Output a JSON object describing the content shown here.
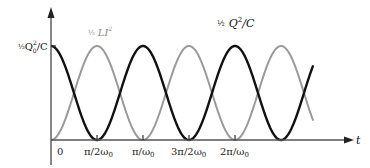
{
  "chart_data": {
    "type": "line",
    "title": "",
    "xlabel": "t",
    "ylabel": "",
    "x_unit": "pi/omega0",
    "x_ticks": [
      {
        "value": 0,
        "label": "0"
      },
      {
        "value": 0.5,
        "label": "π/2ω₀"
      },
      {
        "value": 1.0,
        "label": "π/ω₀"
      },
      {
        "value": 1.5,
        "label": "3π/2ω₀"
      },
      {
        "value": 2.0,
        "label": "2π/ω₀"
      }
    ],
    "y_ticks": [
      {
        "value": 1,
        "label": "½Q₀²/C"
      }
    ],
    "xlim": [
      0,
      2.85
    ],
    "ylim": [
      0,
      1
    ],
    "grid": false,
    "series": [
      {
        "name": "½ Q²/C",
        "formula": "cos^2(omega0 t)",
        "color": "#111111",
        "x": [
          0,
          0.25,
          0.5,
          0.75,
          1.0,
          1.25,
          1.5,
          1.75,
          2.0,
          2.25,
          2.5,
          2.75,
          2.85
        ],
        "values": [
          1,
          0.5,
          0,
          0.5,
          1,
          0.5,
          0,
          0.5,
          1,
          0.5,
          0,
          0.5,
          0.79
        ]
      },
      {
        "name": "½ LI²",
        "formula": "sin^2(omega0 t)",
        "color": "#9a9a9a",
        "x": [
          0,
          0.25,
          0.5,
          0.75,
          1.0,
          1.25,
          1.5,
          1.75,
          2.0,
          2.25,
          2.5,
          2.75,
          2.85
        ],
        "values": [
          0,
          0.5,
          1,
          0.5,
          0,
          0.5,
          1,
          0.5,
          0,
          0.5,
          1,
          0.5,
          0.21
        ]
      }
    ],
    "annotations": [
      {
        "text": "½ Q²/C",
        "near_series": "½ Q²/C"
      },
      {
        "text": "½ LI²",
        "near_series": "½ LI²"
      }
    ]
  },
  "labels": {
    "y_max": {
      "frac": "½",
      "main": "Q",
      "sub": "0",
      "sup": "2",
      "tail": "/C"
    },
    "energy_cap": {
      "frac": "½",
      "main": "Q",
      "sup": "2",
      "tail": "/C"
    },
    "energy_ind": {
      "frac": "½",
      "main": "LI",
      "sup": "2"
    },
    "axis_t": "t",
    "ticks": [
      "0",
      "π/2ω",
      "π/ω",
      "3π/2ω",
      "2π/ω"
    ],
    "tick_sub": "0"
  }
}
